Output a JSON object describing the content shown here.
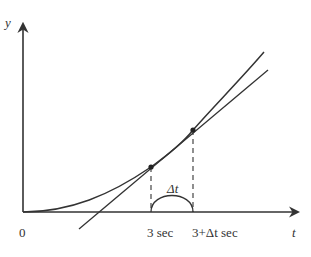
{
  "diagram": {
    "axes": {
      "x_label": "t",
      "y_label": "y",
      "origin_label": "0"
    },
    "tick_labels": {
      "t1": "3 sec",
      "t2": "3+Δt sec"
    },
    "interval_label": "Δt",
    "elements": {
      "curve": "increasing convex curve y(t) starting at origin",
      "secant_line": "straight line through points at t=3 and t=3+Δt",
      "points": [
        "point at t = 3 sec",
        "point at t = 3+Δt sec"
      ],
      "dashed_guides": [
        "vertical dashed line from t=3 point to axis",
        "vertical dashed line from t=3+Δt point to axis"
      ],
      "interval_arc": "arc spanning from 3 sec to 3+Δt sec labelled Δt"
    },
    "colors": {
      "stroke": "#333333",
      "background": "#ffffff"
    }
  }
}
